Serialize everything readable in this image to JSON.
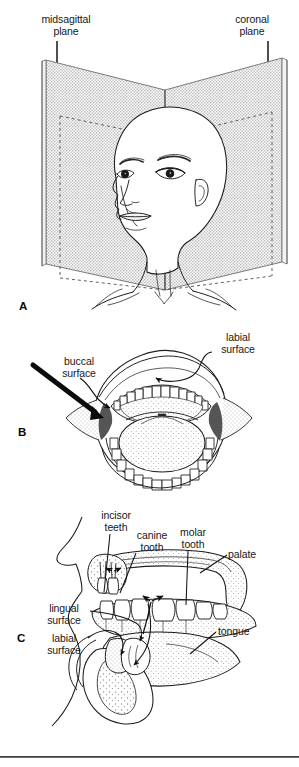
{
  "figure": {
    "background_color": "#ffffff",
    "ink_color": "#171717",
    "plane_fill_color": "#d9d9d9",
    "panels": [
      {
        "id": "A",
        "letter": "A",
        "name": "anatomical-planes-head",
        "description": "Three-quarter view of a bald human head and shoulders intersected by two vertical planes"
      },
      {
        "id": "B",
        "letter": "B",
        "name": "open-mouth-anterior-view",
        "description": "Anterior view of an open mouth showing upper and lower dental arches, tongue and uvula"
      },
      {
        "id": "C",
        "letter": "C",
        "name": "sagittal-section-oral-cavity",
        "description": "Midsagittal section of the face showing palate, dentition, tongue and mandible"
      }
    ]
  },
  "panel_a": {
    "letter": "A",
    "labels": {
      "midsagittal_plane": "midsagittal\nplane",
      "coronal_plane": "coronal\nplane"
    }
  },
  "panel_b": {
    "letter": "B",
    "labels": {
      "buccal_surface": "buccal\nsurface",
      "labial_surface": "labial\nsurface"
    }
  },
  "panel_c": {
    "letter": "C",
    "labels": {
      "incisor_teeth": "incisor\nteeth",
      "canine_tooth": "canine\ntooth",
      "molar_tooth": "molar\ntooth",
      "palate": "palate",
      "lingual_surface": "lingual\nsurface",
      "labial_surface": "labial\nsurface",
      "tongue": "tongue"
    }
  },
  "footer": {
    "caption_partial": ""
  }
}
